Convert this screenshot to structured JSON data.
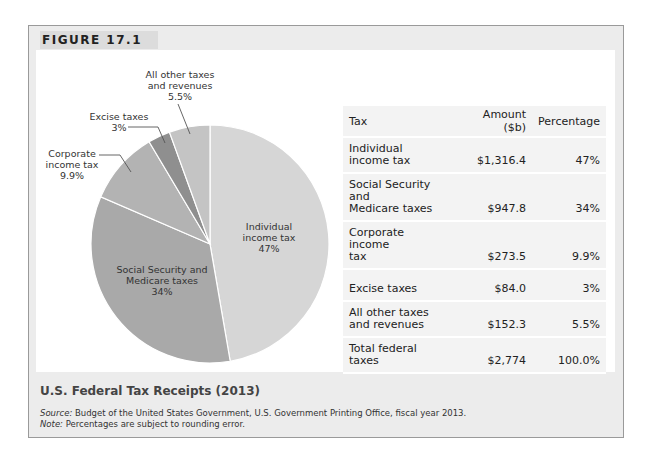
{
  "figure": {
    "tag": "FIGURE 17.1",
    "caption": "U.S. Federal Tax Receipts (2013)",
    "source_label": "Source:",
    "source_text": " Budget of the United States Government, U.S. Government Printing Office, fiscal year 2013.",
    "note_label": "Note:",
    "note_text": " Percentages are subject to rounding error."
  },
  "pie_labels": {
    "individual": [
      "Individual",
      "income tax",
      "47%"
    ],
    "social": [
      "Social Security and",
      "Medicare taxes",
      "34%"
    ],
    "corporate": [
      "Corporate",
      "income tax",
      "9.9%"
    ],
    "excise": [
      "Excise taxes",
      "3%"
    ],
    "other": [
      "All other taxes",
      "and revenues",
      "5.5%"
    ]
  },
  "table": {
    "headers": [
      "Tax",
      "Amount ($b)",
      "Percentage"
    ],
    "rows": [
      {
        "tax": [
          "Individual",
          "income tax"
        ],
        "amount": "$1,316.4",
        "pct": "47%"
      },
      {
        "tax": [
          "Social Security and",
          "Medicare taxes"
        ],
        "amount": "$947.8",
        "pct": "34%"
      },
      {
        "tax": [
          "Corporate income",
          "tax"
        ],
        "amount": "$273.5",
        "pct": "9.9%"
      },
      {
        "tax": [
          "Excise taxes"
        ],
        "amount": "$84.0",
        "pct": "3%"
      },
      {
        "tax": [
          "All other taxes",
          "and revenues"
        ],
        "amount": "$152.3",
        "pct": "5.5%"
      },
      {
        "tax": [
          "Total federal",
          "taxes"
        ],
        "amount": "$2,774",
        "pct": "100.0%"
      }
    ]
  },
  "colors": {
    "individual": "#d6d6d6",
    "social": "#a9a9a9",
    "corporate": "#b3b3b3",
    "excise": "#8f8f8f",
    "other": "#c4c4c4",
    "frame_bg": "#ececec",
    "table_bg": "#f3f3f3"
  },
  "chart_data": {
    "type": "pie",
    "title": "U.S. Federal Tax Receipts (2013)",
    "categories": [
      "Individual income tax",
      "Social Security and Medicare taxes",
      "Corporate income tax",
      "Excise taxes",
      "All other taxes and revenues"
    ],
    "values": [
      47,
      34,
      9.9,
      3,
      5.5
    ],
    "amounts_billion_usd": [
      1316.4,
      947.8,
      273.5,
      84.0,
      152.3
    ],
    "total_billion_usd": 2774,
    "unit": "%",
    "legend": "none (direct labels)"
  }
}
